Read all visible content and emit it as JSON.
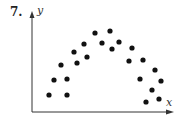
{
  "problem_number": "7.",
  "chart_data": {
    "type": "scatter",
    "title": "",
    "xlabel": "x",
    "ylabel": "y",
    "grid": false,
    "legend": null,
    "axis_ticks": "none",
    "note": "Coordinates in pixel space relative to origin (axes intersection at bottom-left); y increases upward. Points form an inverted-U (concave down) pattern.",
    "points": [
      {
        "x": 17,
        "y": 17
      },
      {
        "x": 22,
        "y": 32
      },
      {
        "x": 29,
        "y": 47
      },
      {
        "x": 35,
        "y": 33
      },
      {
        "x": 35,
        "y": 17
      },
      {
        "x": 42,
        "y": 60
      },
      {
        "x": 45,
        "y": 49
      },
      {
        "x": 52,
        "y": 68
      },
      {
        "x": 55,
        "y": 55
      },
      {
        "x": 63,
        "y": 79
      },
      {
        "x": 70,
        "y": 69
      },
      {
        "x": 78,
        "y": 81
      },
      {
        "x": 80,
        "y": 63
      },
      {
        "x": 87,
        "y": 70
      },
      {
        "x": 97,
        "y": 51
      },
      {
        "x": 100,
        "y": 64
      },
      {
        "x": 108,
        "y": 33
      },
      {
        "x": 111,
        "y": 52
      },
      {
        "x": 114,
        "y": 10
      },
      {
        "x": 120,
        "y": 22
      },
      {
        "x": 123,
        "y": 42
      },
      {
        "x": 127,
        "y": 13
      },
      {
        "x": 129,
        "y": 31
      }
    ],
    "xlim": [
      0,
      140
    ],
    "ylim": [
      0,
      99
    ]
  },
  "style": {
    "dot_color": "#111111",
    "axis_color": "#333333",
    "dot_radius": 2.6
  }
}
